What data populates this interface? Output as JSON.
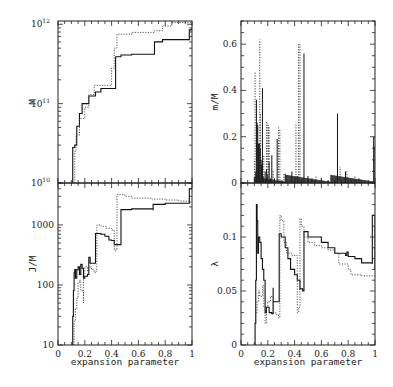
{
  "chart_data": [
    {
      "id": "M",
      "type": "line",
      "panel": "top-left",
      "ylabel": "M",
      "xlabel": "",
      "yscale": "log",
      "ylim": [
        10000000000.0,
        1100000000000.0
      ],
      "xlim": [
        0,
        1
      ],
      "yticks": [
        {
          "v": 10000000000.0,
          "label": "10",
          "exp": "10"
        },
        {
          "v": 100000000000.0,
          "label": "10",
          "exp": "11"
        },
        {
          "v": 1000000000000.0,
          "label": "10",
          "exp": "12"
        }
      ],
      "series": [
        {
          "name": "solid",
          "style": "solid",
          "x": [
            0.1,
            0.11,
            0.11,
            0.125,
            0.125,
            0.14,
            0.14,
            0.16,
            0.16,
            0.18,
            0.18,
            0.2,
            0.2,
            0.23,
            0.23,
            0.28,
            0.28,
            0.32,
            0.32,
            0.43,
            0.43,
            0.47,
            0.47,
            0.55,
            0.55,
            0.72,
            0.72,
            0.78,
            0.78,
            0.98,
            0.98,
            1.0
          ],
          "y": [
            10000000000.0,
            10000000000.0,
            28000000000.0,
            28000000000.0,
            30000000000.0,
            30000000000.0,
            52000000000.0,
            52000000000.0,
            75000000000.0,
            75000000000.0,
            100000000000.0,
            100000000000.0,
            100000000000.0,
            100000000000.0,
            125000000000.0,
            135000000000.0,
            140000000000.0,
            150000000000.0,
            155000000000.0,
            160000000000.0,
            390000000000.0,
            390000000000.0,
            410000000000.0,
            410000000000.0,
            420000000000.0,
            440000000000.0,
            600000000000.0,
            600000000000.0,
            640000000000.0,
            680000000000.0,
            850000000000.0,
            900000000000.0
          ]
        },
        {
          "name": "dotted",
          "style": "dotted",
          "x": [
            0.125,
            0.125,
            0.135,
            0.135,
            0.16,
            0.16,
            0.2,
            0.2,
            0.23,
            0.23,
            0.27,
            0.27,
            0.4,
            0.4,
            0.42,
            0.42,
            0.44,
            0.44,
            0.55,
            0.55,
            0.72,
            0.72,
            0.78,
            0.78,
            0.85,
            0.85,
            1.0
          ],
          "y": [
            10000000000.0,
            25000000000.0,
            25000000000.0,
            40000000000.0,
            40000000000.0,
            65000000000.0,
            65000000000.0,
            90000000000.0,
            90000000000.0,
            130000000000.0,
            160000000000.0,
            170000000000.0,
            200000000000.0,
            280000000000.0,
            300000000000.0,
            500000000000.0,
            500000000000.0,
            750000000000.0,
            770000000000.0,
            790000000000.0,
            800000000000.0,
            830000000000.0,
            900000000000.0,
            950000000000.0,
            1000000000000.0,
            1050000000000.0,
            1050000000000.0
          ]
        }
      ]
    },
    {
      "id": "J_over_M",
      "type": "line",
      "panel": "bottom-left",
      "ylabel": "J/M",
      "xlabel": "expansion parameter",
      "yscale": "log",
      "ylim": [
        10,
        5000
      ],
      "xlim": [
        0,
        1
      ],
      "yticks": [
        {
          "v": 10,
          "label": "10"
        },
        {
          "v": 100,
          "label": "100"
        },
        {
          "v": 1000,
          "label": "1000"
        }
      ],
      "xticks": [
        0,
        0.2,
        0.4,
        0.6,
        0.8,
        1
      ],
      "xtick_labels": [
        "0",
        "0.2",
        "0.4",
        "0.6",
        "0.8",
        "1"
      ],
      "series": [
        {
          "name": "solid",
          "style": "solid",
          "x": [
            0.1,
            0.11,
            0.11,
            0.115,
            0.12,
            0.125,
            0.13,
            0.14,
            0.15,
            0.16,
            0.17,
            0.18,
            0.19,
            0.2,
            0.22,
            0.23,
            0.24,
            0.24,
            0.28,
            0.28,
            0.32,
            0.35,
            0.38,
            0.4,
            0.42,
            0.42,
            0.47,
            0.47,
            0.55,
            0.65,
            0.71,
            0.71,
            0.78,
            0.8,
            0.9,
            0.98,
            0.98,
            1.0
          ],
          "y": [
            10,
            20,
            30,
            80,
            160,
            180,
            130,
            180,
            200,
            150,
            220,
            190,
            130,
            140,
            150,
            290,
            230,
            230,
            230,
            720,
            700,
            650,
            560,
            550,
            500,
            470,
            470,
            1800,
            1850,
            1850,
            1750,
            2200,
            2200,
            2300,
            2300,
            2300,
            4000,
            4200
          ]
        },
        {
          "name": "dotted",
          "style": "dotted",
          "x": [
            0.1,
            0.12,
            0.13,
            0.14,
            0.15,
            0.16,
            0.17,
            0.19,
            0.19,
            0.2,
            0.22,
            0.23,
            0.25,
            0.27,
            0.28,
            0.29,
            0.29,
            0.32,
            0.36,
            0.4,
            0.42,
            0.42,
            0.44,
            0.44,
            0.5,
            0.55,
            0.7,
            0.8,
            0.9,
            0.98,
            1.0
          ],
          "y": [
            10,
            25,
            40,
            60,
            110,
            120,
            80,
            50,
            130,
            200,
            170,
            200,
            180,
            160,
            170,
            270,
            1000,
            950,
            880,
            820,
            400,
            380,
            600,
            3200,
            3000,
            2800,
            2700,
            2600,
            2500,
            2400,
            2500
          ]
        }
      ]
    },
    {
      "id": "m_over_M",
      "type": "bar",
      "panel": "top-right",
      "ylabel": "m/M",
      "xlabel": "",
      "ylim": [
        0,
        0.7
      ],
      "xlim": [
        0,
        1
      ],
      "yticks": [
        0,
        0.2,
        0.4,
        0.6
      ],
      "ytick_labels": [
        "0",
        "0.2",
        "0.4",
        "0.6"
      ],
      "series": [
        {
          "name": "solid",
          "style": "solid",
          "x": [
            0.11,
            0.115,
            0.12,
            0.125,
            0.13,
            0.135,
            0.14,
            0.145,
            0.15,
            0.155,
            0.16,
            0.165,
            0.17,
            0.18,
            0.19,
            0.2,
            0.21,
            0.22,
            0.23,
            0.25,
            0.27,
            0.29,
            0.31,
            0.33,
            0.38,
            0.4,
            0.42,
            0.45,
            0.47,
            0.5,
            0.53,
            0.6,
            0.65,
            0.7,
            0.72,
            0.78,
            0.82,
            0.88,
            0.99,
            1.0
          ],
          "y": [
            0.05,
            0.36,
            0.26,
            0.25,
            0.17,
            0.17,
            0.17,
            0.15,
            0.1,
            0.08,
            0.41,
            0.03,
            0.02,
            0.05,
            0.06,
            0.04,
            0.09,
            0.02,
            0.12,
            0.02,
            0.19,
            0.01,
            0.01,
            0.04,
            0.05,
            0.02,
            0.03,
            0.01,
            0.56,
            0.03,
            0.02,
            0.02,
            0.01,
            0.01,
            0.3,
            0.05,
            0.02,
            0.02,
            0.2,
            0.16
          ]
        },
        {
          "name": "dotted",
          "style": "dotted",
          "x": [
            0.1,
            0.105,
            0.12,
            0.14,
            0.145,
            0.17,
            0.19,
            0.2,
            0.205,
            0.21,
            0.23,
            0.24,
            0.28,
            0.29,
            0.32,
            0.38,
            0.41,
            0.43,
            0.44,
            0.56,
            0.74,
            0.79,
            0.85
          ],
          "y": [
            0.1,
            0.48,
            0.1,
            0.62,
            0.3,
            0.12,
            0.27,
            0.26,
            0.25,
            0.24,
            0.05,
            0.05,
            0.24,
            0.23,
            0.04,
            0.03,
            0.26,
            0.6,
            0.6,
            0.03,
            0.07,
            0.05,
            0.03
          ]
        }
      ]
    },
    {
      "id": "lambda",
      "type": "line",
      "panel": "bottom-right",
      "ylabel": "λ",
      "xlabel": "expansion parameter",
      "ylim": [
        0,
        0.15
      ],
      "xlim": [
        0,
        1
      ],
      "yticks": [
        0,
        0.05,
        0.1
      ],
      "ytick_labels": [
        "0",
        "0.05",
        "0.1"
      ],
      "xticks": [
        0,
        0.2,
        0.4,
        0.6,
        0.8,
        1
      ],
      "xtick_labels": [
        "0",
        "0.2",
        "0.4",
        "0.6",
        "0.8",
        "1"
      ],
      "series": [
        {
          "name": "solid",
          "style": "solid",
          "x": [
            0.1,
            0.105,
            0.11,
            0.115,
            0.12,
            0.125,
            0.13,
            0.14,
            0.15,
            0.16,
            0.17,
            0.18,
            0.19,
            0.2,
            0.21,
            0.22,
            0.23,
            0.24,
            0.24,
            0.25,
            0.28,
            0.285,
            0.3,
            0.33,
            0.35,
            0.37,
            0.4,
            0.42,
            0.44,
            0.46,
            0.47,
            0.47,
            0.5,
            0.53,
            0.6,
            0.65,
            0.7,
            0.78,
            0.79,
            0.8,
            0.85,
            0.9,
            0.98,
            0.98,
            1.0,
            1.0
          ],
          "y": [
            0.0,
            0.02,
            0.06,
            0.13,
            0.115,
            0.085,
            0.1,
            0.095,
            0.08,
            0.07,
            0.06,
            0.03,
            0.035,
            0.035,
            0.03,
            0.03,
            0.029,
            0.053,
            0.04,
            0.04,
            0.04,
            0.103,
            0.1,
            0.09,
            0.08,
            0.07,
            0.065,
            0.06,
            0.052,
            0.05,
            0.05,
            0.105,
            0.1,
            0.1,
            0.095,
            0.09,
            0.085,
            0.083,
            0.086,
            0.082,
            0.08,
            0.076,
            0.075,
            0.12,
            0.12,
            0.07
          ]
        },
        {
          "name": "dotted",
          "style": "dotted",
          "x": [
            0.1,
            0.11,
            0.12,
            0.13,
            0.14,
            0.16,
            0.17,
            0.18,
            0.19,
            0.2,
            0.22,
            0.24,
            0.26,
            0.28,
            0.29,
            0.3,
            0.32,
            0.34,
            0.38,
            0.42,
            0.43,
            0.44,
            0.45,
            0.47,
            0.5,
            0.55,
            0.6,
            0.65,
            0.7,
            0.73,
            0.8,
            0.82,
            0.9,
            1.0
          ],
          "y": [
            0.02,
            0.03,
            0.04,
            0.05,
            0.045,
            0.055,
            0.035,
            0.02,
            0.035,
            0.04,
            0.045,
            0.03,
            0.028,
            0.025,
            0.12,
            0.115,
            0.095,
            0.085,
            0.083,
            0.03,
            0.035,
            0.117,
            0.11,
            0.1,
            0.095,
            0.092,
            0.09,
            0.088,
            0.085,
            0.075,
            0.07,
            0.065,
            0.064,
            0.063
          ]
        }
      ]
    }
  ],
  "labels": {
    "panel_M": {
      "ylabel": "M"
    },
    "panel_JM": {
      "ylabel": "J/M",
      "xlabel": "expansion parameter"
    },
    "panel_mM": {
      "ylabel": "m/M"
    },
    "panel_lambda": {
      "ylabel": "λ",
      "xlabel": "expansion parameter"
    }
  }
}
